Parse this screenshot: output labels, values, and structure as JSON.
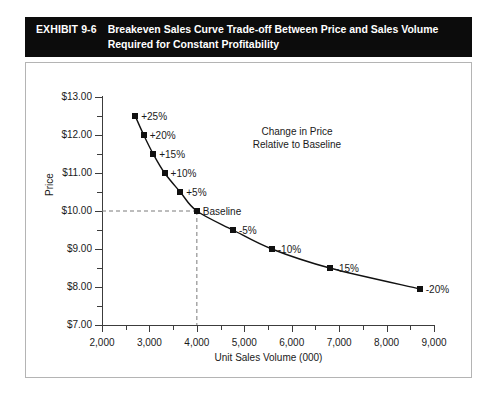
{
  "exhibit": {
    "label": "EXHIBIT 9-6",
    "title_line1": "Breakeven Sales Curve Trade-off Between Price and Sales Volume",
    "title_line2": "Required for Constant Profitability"
  },
  "annotation": {
    "line1": "Change in Price",
    "line2": "Relative to Baseline"
  },
  "chart_data": {
    "type": "line",
    "title": "Breakeven Sales Curve Trade-off Between Price and Sales Volume Required for Constant Profitability",
    "xlabel": "Unit Sales Volume (000)",
    "ylabel": "Price",
    "xlim": [
      2000,
      9000
    ],
    "ylim": [
      7.0,
      13.0
    ],
    "xticks": [
      2000,
      3000,
      4000,
      5000,
      6000,
      7000,
      8000,
      9000
    ],
    "xticklabels": [
      "2,000",
      "3,000",
      "4,000",
      "5,000",
      "6,000",
      "7,000",
      "8,000",
      "9,000"
    ],
    "xminor_step": 500,
    "yticks": [
      7.0,
      8.0,
      9.0,
      10.0,
      11.0,
      12.0,
      13.0
    ],
    "yticklabels": [
      "$7.00",
      "$8.00",
      "$9.00",
      "$10.00",
      "$11.00",
      "$12.00",
      "$13.00"
    ],
    "yminor_step": 0.5,
    "grid": false,
    "legend": "none",
    "marker": "filled-square",
    "baseline": {
      "x": 4000,
      "y": 10.0,
      "label": "Baseline",
      "guide_lines": "dashed"
    },
    "series": [
      {
        "name": "Breakeven sales curve",
        "points": [
          {
            "x": 2700,
            "y": 12.5,
            "label": "+25%"
          },
          {
            "x": 2880,
            "y": 12.0,
            "label": "+20%"
          },
          {
            "x": 3080,
            "y": 11.5,
            "label": "+15%"
          },
          {
            "x": 3320,
            "y": 11.0,
            "label": "+10%"
          },
          {
            "x": 3650,
            "y": 10.5,
            "label": "+5%"
          },
          {
            "x": 4000,
            "y": 10.0,
            "label": "Baseline"
          },
          {
            "x": 4760,
            "y": 9.5,
            "label": "-5%"
          },
          {
            "x": 5580,
            "y": 9.0,
            "label": "-10%"
          },
          {
            "x": 6800,
            "y": 8.5,
            "label": "-15%"
          },
          {
            "x": 8700,
            "y": 7.95,
            "label": "-20%"
          }
        ]
      }
    ]
  }
}
